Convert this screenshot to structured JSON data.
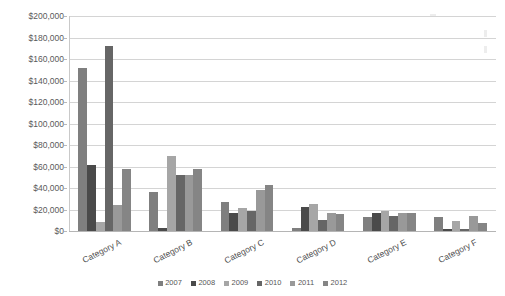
{
  "chart_data": {
    "type": "bar",
    "title": "",
    "subtitle": "",
    "xlabel": "",
    "ylabel": "",
    "categories": [
      "Category A",
      "Category B",
      "Category C",
      "Category D",
      "Category E",
      "Category F"
    ],
    "series": [
      {
        "name": "2007",
        "color": "#7f7f7f",
        "values": [
          152000,
          36000,
          27000,
          3000,
          13000,
          13000
        ]
      },
      {
        "name": "2008",
        "color": "#4a4a4a",
        "values": [
          61000,
          3000,
          17000,
          22000,
          17000,
          2000
        ]
      },
      {
        "name": "2009",
        "color": "#a6a6a6",
        "values": [
          8000,
          70000,
          21000,
          25000,
          19000,
          9000
        ]
      },
      {
        "name": "2010",
        "color": "#666666",
        "values": [
          172000,
          52000,
          19000,
          10000,
          14000,
          2000
        ]
      },
      {
        "name": "2011",
        "color": "#999999",
        "values": [
          24000,
          52000,
          38000,
          17000,
          17000,
          14000
        ]
      },
      {
        "name": "2012",
        "color": "#858585",
        "values": [
          58000,
          58000,
          43000,
          16000,
          17000,
          7000
        ]
      }
    ],
    "ylim": [
      0,
      200000
    ],
    "ytick_values": [
      0,
      20000,
      40000,
      60000,
      80000,
      100000,
      120000,
      140000,
      160000,
      180000,
      200000
    ],
    "ytick_labels": [
      "$0",
      "$20,000",
      "$40,000",
      "$60,000",
      "$80,000",
      "$100,000",
      "$120,000",
      "$140,000",
      "$160,000",
      "$180,000",
      "$200,000"
    ],
    "grid": true,
    "grid_axis": "y",
    "legend_position": "bottom",
    "plot_background": "#ffffff",
    "gridline_color": "#d4d4d4"
  }
}
